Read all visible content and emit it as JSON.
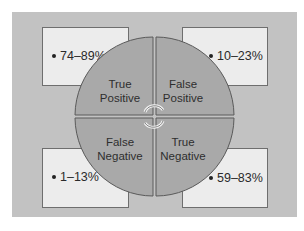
{
  "diagram": {
    "title": "",
    "colors": {
      "panel_bg": "#c2c2c2",
      "box_fill": "#ececec",
      "box_border": "#6e6e6e",
      "circle_fill": "#a9a9a9",
      "circle_stroke": "#5a5a5a",
      "arrow_color": "#f2f2f2"
    },
    "quadrants": [
      {
        "id": "true-positive",
        "label_line1": "True",
        "label_line2": "Positive",
        "range": "74–89%"
      },
      {
        "id": "false-positive",
        "label_line1": "False",
        "label_line2": "Positive",
        "range": "10–23%"
      },
      {
        "id": "false-negative",
        "label_line1": "False",
        "label_line2": "Negative",
        "range": "1–13%"
      },
      {
        "id": "true-negative",
        "label_line1": "True",
        "label_line2": "Negative",
        "range": "59–83%"
      }
    ],
    "center_icon": "circular-arrows-icon"
  }
}
